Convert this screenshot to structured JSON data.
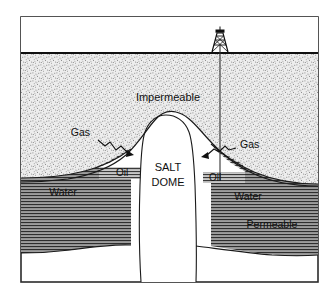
{
  "figure": {
    "name": "salt-dome-petroleum-trap-cross-section",
    "frame_color": "#2b2b2b",
    "background_color": "#ffffff"
  },
  "labels": {
    "impermeable": "Impermeable",
    "gas_left": "Gas",
    "gas_right": "Gas",
    "oil_left": "Oil",
    "oil_right": "Oil",
    "salt_dome_line1": "SALT",
    "salt_dome_line2": "DOME",
    "water_left": "Water",
    "water_right": "Water",
    "permeable": "Permeable"
  },
  "layers": [
    {
      "name": "sky",
      "label": "",
      "fill": "#ffffff",
      "pattern": "none"
    },
    {
      "name": "impermeable-caprock",
      "label": "Impermeable",
      "fill": "#e2e2e2",
      "pattern": "stipple"
    },
    {
      "name": "gas-cap",
      "label": "Gas",
      "fill": "#ffffff",
      "pattern": "none"
    },
    {
      "name": "oil-band",
      "label": "Oil",
      "fill": "#b9b9b9",
      "pattern": "horizontal-lines"
    },
    {
      "name": "water-band",
      "label": "Water",
      "fill": "#9e9e9e",
      "pattern": "horizontal-lines"
    },
    {
      "name": "permeable-band",
      "label": "Permeable",
      "fill": "#9e9e9e",
      "pattern": "horizontal-lines"
    },
    {
      "name": "salt-dome",
      "label": "SALT DOME",
      "fill": "#ffffff",
      "pattern": "none"
    },
    {
      "name": "basement",
      "label": "",
      "fill": "#ffffff",
      "pattern": "none"
    }
  ],
  "annotations": {
    "derrick": {
      "name": "oil-derrick",
      "description": "drilling rig tower at ground surface"
    },
    "wellbore": {
      "name": "wellbore-line",
      "description": "vertical borehole from derrick into oil zone"
    },
    "gas_arrow_left": {
      "name": "gas-leader-arrow-left",
      "description": "zigzag leader line pointing to left gas cap"
    },
    "gas_arrow_right": {
      "name": "gas-leader-arrow-right",
      "description": "zigzag leader line pointing to right gas cap"
    }
  },
  "colors": {
    "ink": "#101010",
    "stipple": "#e4e4e4",
    "oil_gray": "#bdbdbd",
    "water_gray": "#a0a0a0",
    "line": "#1a1a1a"
  }
}
